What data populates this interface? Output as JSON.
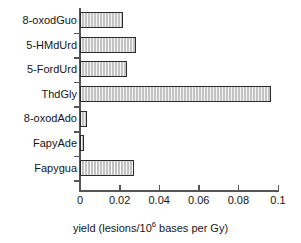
{
  "chart_data": {
    "type": "bar",
    "orientation": "horizontal",
    "title": "",
    "xlabel": "yield (lesions/10⁶ bases per Gy)",
    "ylabel": "",
    "categories": [
      "8-oxodGuo",
      "5-HMdUrd",
      "5-FordUrd",
      "ThdGly",
      "8-oxodAdo",
      "FapyAde",
      "Fapygua"
    ],
    "values": [
      0.0215,
      0.0285,
      0.0235,
      0.0965,
      0.0035,
      0.0018,
      0.0275
    ],
    "xlim": [
      0,
      0.1
    ],
    "xticks": [
      0,
      0.02,
      0.04,
      0.06,
      0.08,
      0.1
    ],
    "xtick_labels": [
      "0",
      "0.02",
      "0.04",
      "0.06",
      "0.08",
      "0.1"
    ],
    "grid": false,
    "legend": null,
    "bar_fill_color": "#c3c3c3",
    "bar_edge_color": "#2b2b2b",
    "axis_color": "#555555"
  },
  "axis_title": {
    "prefix": "yield (lesions/10",
    "superscript": "6",
    "suffix": " bases per Gy)"
  }
}
